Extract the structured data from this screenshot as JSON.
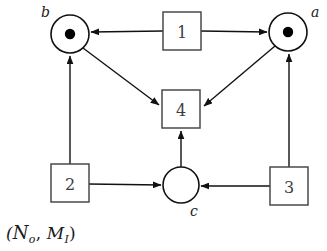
{
  "figure": {
    "kind": "petri-net",
    "caption": {
      "open_paren": "(",
      "net_symbol": "N",
      "net_subscript": "o",
      "comma": ", ",
      "marking_symbol": "M",
      "marking_subscript": "I",
      "close_paren": ")",
      "full_text": "(No, MI)"
    },
    "colors": {
      "stroke": "#111111",
      "box_stroke": "#4a4a4a",
      "fill": "#ffffff",
      "token": "#000000",
      "text": "#1a1a1a"
    },
    "places": [
      {
        "id": "b",
        "label": "b",
        "cx": 70,
        "cy": 34,
        "r": 19,
        "tokens": 1,
        "label_x": 41,
        "label_y": 17
      },
      {
        "id": "a",
        "label": "a",
        "cx": 288,
        "cy": 32,
        "r": 19,
        "tokens": 1,
        "label_x": 311,
        "label_y": 17
      },
      {
        "id": "c",
        "label": "c",
        "cx": 181,
        "cy": 185,
        "r": 18,
        "tokens": 0,
        "label_x": 190,
        "label_y": 216
      }
    ],
    "transitions": [
      {
        "id": "t1",
        "label": "1",
        "x": 163,
        "y": 12,
        "w": 38,
        "h": 38
      },
      {
        "id": "t4",
        "label": "4",
        "x": 162,
        "y": 90,
        "w": 38,
        "h": 38
      },
      {
        "id": "t2",
        "label": "2",
        "x": 51,
        "y": 164,
        "w": 38,
        "h": 38
      },
      {
        "id": "t3",
        "label": "3",
        "x": 270,
        "y": 167,
        "w": 38,
        "h": 38
      }
    ],
    "arcs": [
      {
        "id": "t1-to-b",
        "from": "t1",
        "to": "b",
        "d": "M 163 31 L 91 32"
      },
      {
        "id": "t1-to-a",
        "from": "t1",
        "to": "a",
        "d": "M 201 31 L 267 32"
      },
      {
        "id": "b-to-t4",
        "from": "b",
        "to": "t4",
        "d": "M 83 48 L 159 105"
      },
      {
        "id": "a-to-t4",
        "from": "a",
        "to": "t4",
        "d": "M 275 46 L 204 106"
      },
      {
        "id": "t2-to-b",
        "from": "t2",
        "to": "b",
        "d": "M 70 164 L 70 56"
      },
      {
        "id": "t2-to-c",
        "from": "t2",
        "to": "c",
        "d": "M 89 184 L 161 185"
      },
      {
        "id": "t3-to-a",
        "from": "t3",
        "to": "a",
        "d": "M 289 167 L 289 54"
      },
      {
        "id": "t3-to-c",
        "from": "t3",
        "to": "c",
        "d": "M 270 186 L 201 186"
      },
      {
        "id": "c-to-t4",
        "from": "c",
        "to": "t4",
        "d": "M 181 167 L 181 131"
      }
    ]
  }
}
